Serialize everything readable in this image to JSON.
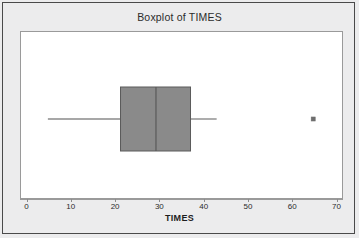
{
  "chart_data": {
    "type": "boxplot",
    "title": "Boxplot of TIMES",
    "xlabel": "TIMES",
    "ylabel": "",
    "orientation": "horizontal",
    "grid": false,
    "legend": null,
    "xlim": [
      0,
      71
    ],
    "xticks": [
      0,
      10,
      20,
      30,
      40,
      50,
      60,
      70
    ],
    "xtick_labels": [
      "0",
      "10",
      "20",
      "30",
      "40",
      "50",
      "60",
      "70"
    ],
    "categories": [
      "TIMES"
    ],
    "series": [
      {
        "name": "TIMES",
        "min_whisker": 4.6,
        "q1": 21.0,
        "median": 29.0,
        "q3": 36.8,
        "max_whisker": 42.7,
        "outliers": [
          64.5
        ]
      }
    ],
    "box_fill_color": "#8a8a8a",
    "box_line_color": "#5a5a5a",
    "whisker_color": "#8a8a8a",
    "outlier_marker": "square",
    "outlier_color": "#6e6e6e",
    "plot_background": "#ffffff",
    "figure_background": "#ececed",
    "frame_color": "#9a9a9a"
  }
}
